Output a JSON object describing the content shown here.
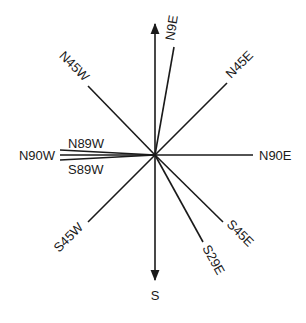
{
  "diagram": {
    "center": [
      155,
      155
    ],
    "colors": {
      "line": "#1a1a1a",
      "background": "#ffffff"
    },
    "axes": {
      "north_arrow": {
        "from": [
          155,
          155
        ],
        "to": [
          155,
          22
        ]
      },
      "south_arrow": {
        "label": "S",
        "from": [
          155,
          155
        ],
        "to": [
          155,
          282
        ]
      }
    },
    "labels": {
      "S": "S",
      "N9E": "N9E",
      "N45E": "N45E",
      "N45W": "N45W",
      "N89W": "N89W",
      "N90W": "N90W",
      "S89W": "S89W",
      "N90E": "N90E",
      "S45W": "S45W",
      "S29E": "S29E",
      "S45E": "S45E"
    },
    "bearings": [
      {
        "label": "N9E",
        "end": [
          174,
          47
        ]
      },
      {
        "label": "N45E",
        "end": [
          227,
          83
        ]
      },
      {
        "label": "N90E",
        "end": [
          253,
          155
        ]
      },
      {
        "label": "S45E",
        "end": [
          223,
          222
        ]
      },
      {
        "label": "S29E",
        "end": [
          203,
          242
        ]
      },
      {
        "label": "S45W",
        "end": [
          88,
          222
        ]
      },
      {
        "label": "S89W",
        "end": [
          60,
          157
        ]
      },
      {
        "label": "N90W",
        "end": [
          60,
          155
        ]
      },
      {
        "label": "N89W",
        "end": [
          60,
          151
        ]
      },
      {
        "label": "N45W",
        "end": [
          88,
          86
        ]
      }
    ]
  }
}
